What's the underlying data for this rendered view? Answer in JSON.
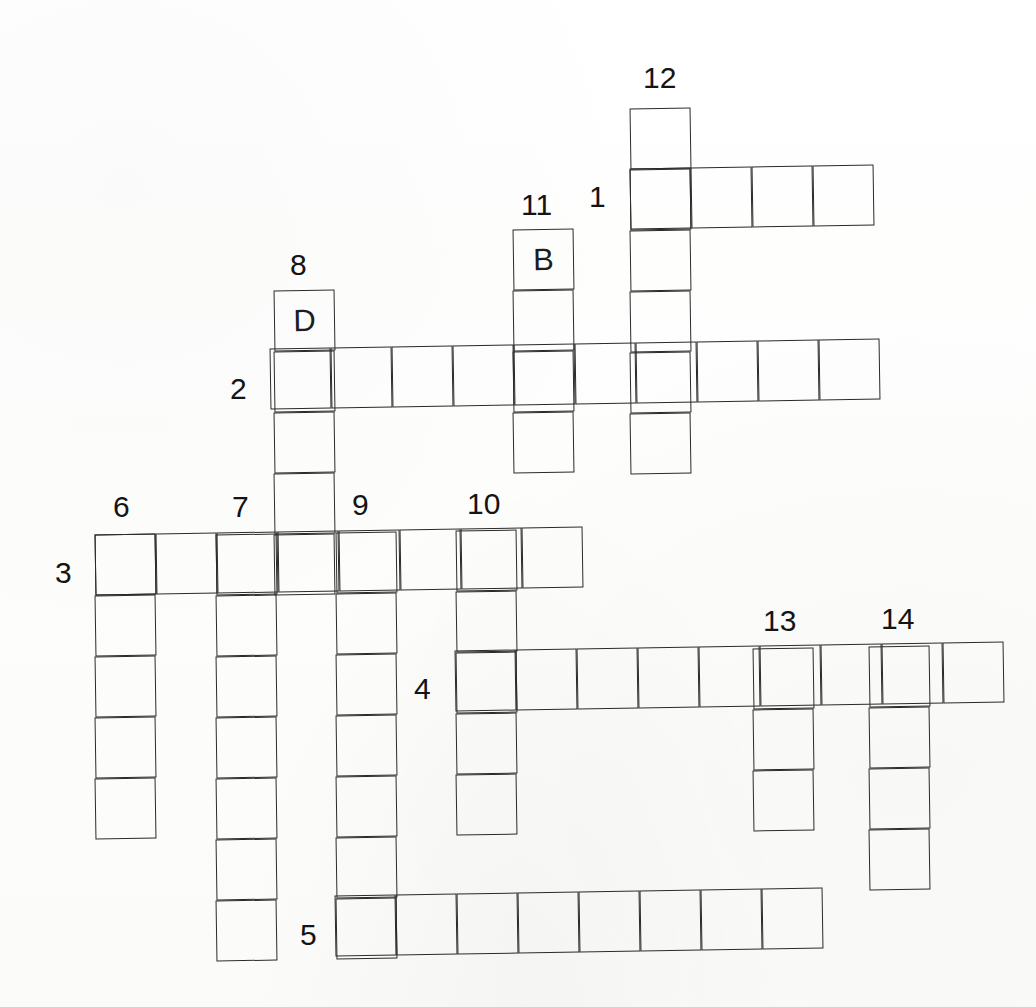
{
  "document": {
    "type": "crossword-puzzle-grid",
    "title": "Crossword Puzzle",
    "background_color": "#ffffff",
    "line_color": "#2b2b2b",
    "text_color": "#141414",
    "cell_size": 61
  },
  "grid": {
    "cell_size": 61,
    "across_entries": [
      {
        "number": "1",
        "direction": "across",
        "length": 4,
        "start": {
          "x": 630,
          "y": 168
        },
        "skew": -0.9,
        "label_position": {
          "x": 589,
          "y": 182
        }
      },
      {
        "number": "2",
        "direction": "across",
        "length": 10,
        "start": {
          "x": 270,
          "y": 348
        },
        "skew": -0.9,
        "label_position": {
          "x": 230,
          "y": 374
        }
      },
      {
        "number": "3",
        "direction": "across",
        "length": 8,
        "start": {
          "x": 95,
          "y": 534
        },
        "skew": -0.9,
        "label_position": {
          "x": 55,
          "y": 558
        }
      },
      {
        "number": "4",
        "direction": "across",
        "length": 9,
        "start": {
          "x": 455,
          "y": 650
        },
        "skew": -0.9,
        "label_position": {
          "x": 414,
          "y": 674
        }
      },
      {
        "number": "5",
        "direction": "across",
        "length": 8,
        "start": {
          "x": 335,
          "y": 895
        },
        "skew": -0.9,
        "label_position": {
          "x": 300,
          "y": 920
        }
      }
    ],
    "down_entries": [
      {
        "number": "6",
        "direction": "down",
        "length": 5,
        "start": {
          "x": 95,
          "y": 534
        },
        "skew": -0.9,
        "label_position": {
          "x": 113,
          "y": 492
        }
      },
      {
        "number": "7",
        "direction": "down",
        "length": 7,
        "start": {
          "x": 216,
          "y": 534
        },
        "skew": -0.9,
        "label_position": {
          "x": 232,
          "y": 492
        }
      },
      {
        "number": "8",
        "direction": "down",
        "length": 5,
        "start": {
          "x": 274,
          "y": 290
        },
        "skew": -0.9,
        "label_position": {
          "x": 290,
          "y": 250
        },
        "letters": [
          "D",
          "",
          "",
          "",
          ""
        ]
      },
      {
        "number": "9",
        "direction": "down",
        "length": 7,
        "start": {
          "x": 336,
          "y": 532
        },
        "skew": -0.9,
        "label_position": {
          "x": 352,
          "y": 490
        }
      },
      {
        "number": "10",
        "direction": "down",
        "length": 5,
        "start": {
          "x": 456,
          "y": 530
        },
        "skew": -0.9,
        "label_position": {
          "x": 467,
          "y": 489
        }
      },
      {
        "number": "11",
        "direction": "down",
        "length": 4,
        "start": {
          "x": 513,
          "y": 229
        },
        "skew": -0.9,
        "label_position": {
          "x": 521,
          "y": 190
        },
        "letters": [
          "B",
          "",
          "",
          ""
        ]
      },
      {
        "number": "12",
        "direction": "down",
        "length": 6,
        "start": {
          "x": 630,
          "y": 108
        },
        "skew": -0.9,
        "label_position": {
          "x": 643,
          "y": 63
        }
      },
      {
        "number": "13",
        "direction": "down",
        "length": 3,
        "start": {
          "x": 753,
          "y": 648
        },
        "skew": -0.9,
        "label_position": {
          "x": 763,
          "y": 606
        }
      },
      {
        "number": "14",
        "direction": "down",
        "length": 4,
        "start": {
          "x": 869,
          "y": 646
        },
        "skew": -0.9,
        "label_position": {
          "x": 881,
          "y": 604
        }
      }
    ],
    "filled_letters": [
      {
        "letter": "D",
        "clue": "8",
        "position_in_word": 1,
        "x": 274,
        "y": 290
      },
      {
        "letter": "B",
        "clue": "11",
        "position_in_word": 1,
        "x": 513,
        "y": 229
      }
    ],
    "clue_numbers": [
      "1",
      "2",
      "3",
      "4",
      "5",
      "6",
      "7",
      "8",
      "9",
      "10",
      "11",
      "12",
      "13",
      "14"
    ]
  }
}
